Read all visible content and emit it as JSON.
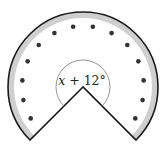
{
  "diagram": {
    "type": "circular-sector-with-dots",
    "center": [
      83,
      87
    ],
    "outer_radius": 75,
    "band_inner_radius": 69,
    "dot_radius_path": 61,
    "dot_count": 14,
    "dot_size": 2.3,
    "notch_angle_deg": 90,
    "angle_label": {
      "variable": "x",
      "operator": " + ",
      "value": "12°",
      "arc_radius": 27
    },
    "colors": {
      "outline": "#1a1a1a",
      "band": "#cfcfcf",
      "dots": "#333333",
      "inner_arc": "#888888",
      "background": "#ffffff"
    }
  }
}
